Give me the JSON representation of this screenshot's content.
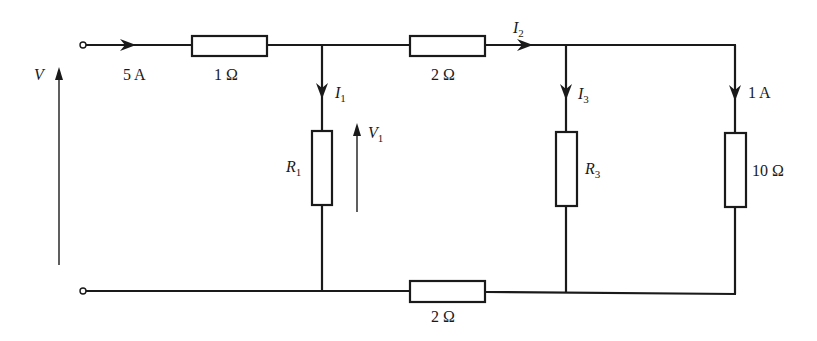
{
  "diagram": {
    "type": "circuit",
    "colors": {
      "ink": "#1a1a1a",
      "background": "#ffffff"
    },
    "source": {
      "voltage_label": "V",
      "current_label": "5 A"
    },
    "resistors": [
      {
        "id": "r-top-left",
        "label": "1 Ω"
      },
      {
        "id": "r-top-mid",
        "label": "2 Ω"
      },
      {
        "id": "r1",
        "label": "R",
        "sub": "1"
      },
      {
        "id": "r3",
        "label": "R",
        "sub": "3"
      },
      {
        "id": "r-right",
        "label": "10 Ω"
      },
      {
        "id": "r-bottom",
        "label": "2 Ω"
      }
    ],
    "currents": [
      {
        "id": "i1",
        "label": "I",
        "sub": "1"
      },
      {
        "id": "i2",
        "label": "I",
        "sub": "2"
      },
      {
        "id": "i3",
        "label": "I",
        "sub": "3"
      },
      {
        "id": "i-right",
        "label": "1 A"
      }
    ],
    "voltages": [
      {
        "id": "v1",
        "label": "V",
        "sub": "1"
      }
    ]
  }
}
